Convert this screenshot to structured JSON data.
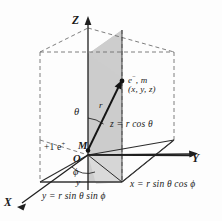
{
  "figure": {
    "background_color": "#fdfdfd",
    "line_color": "#2b2b2b",
    "shade_color": "#c9c9c9",
    "base_shade_color": "#d3d3d3"
  },
  "axes": {
    "z_label": "Z",
    "x_label": "X",
    "y_label": "Y"
  },
  "points": {
    "origin_label": "O",
    "nucleus_label": "M",
    "charge_label_plus": "+1 e",
    "charge_label_plus_sup": "+",
    "electron_label": "e",
    "electron_label_sup": "−",
    "electron_mass": ", m",
    "coordinates_label": "(x, y, z)"
  },
  "angles": {
    "theta": "θ",
    "phi": "ϕ"
  },
  "vectors": {
    "radius_label": "r"
  },
  "equations": {
    "z_equation_lhs": "z",
    "z_equation": "z = r cos θ",
    "x_equation": "x = r sin θ cos ϕ",
    "y_equation": "y = r sin θ sin ϕ",
    "y_side_label": "y"
  },
  "geometry": {
    "origin": [
      88,
      155
    ],
    "nucleus": [
      88,
      150
    ],
    "electron": [
      122,
      82
    ],
    "z_axis_top": [
      88,
      18
    ],
    "x_axis_end": [
      18,
      206
    ],
    "y_axis_end": [
      196,
      156
    ],
    "box_front_bottom_left": [
      40,
      182
    ],
    "box_front_bottom_right": [
      122,
      182
    ],
    "box_base_far_left": [
      40,
      140
    ],
    "box_top_front_left": [
      40,
      52
    ],
    "box_top_back_right": [
      174,
      52
    ],
    "foot_of_perpendicular": [
      122,
      148
    ],
    "z_height_top": [
      122,
      82
    ]
  }
}
